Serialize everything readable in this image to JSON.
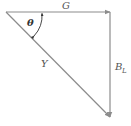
{
  "diagram": {
    "type": "admittance-triangle",
    "labels": {
      "top": "G",
      "hypotenuse": "Y",
      "right_main": "B",
      "right_sub": "L",
      "angle": "θ"
    },
    "colors": {
      "line": "#8c8c8c",
      "text": "#555555",
      "angle_text": "#333333"
    }
  }
}
